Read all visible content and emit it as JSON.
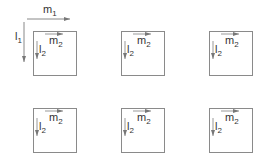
{
  "diagram": {
    "outer_axes": {
      "horizontal": {
        "label": "m",
        "subscript": "1"
      },
      "vertical": {
        "label": "l",
        "subscript": "1"
      }
    },
    "cells": [
      {
        "row": 0,
        "col": 0,
        "h_label": "m",
        "h_sub": "2",
        "v_label": "l",
        "v_sub": "2"
      },
      {
        "row": 0,
        "col": 1,
        "h_label": "m",
        "h_sub": "2",
        "v_label": "l",
        "v_sub": "2"
      },
      {
        "row": 0,
        "col": 2,
        "h_label": "m",
        "h_sub": "2",
        "v_label": "l",
        "v_sub": "2"
      },
      {
        "row": 1,
        "col": 0,
        "h_label": "m",
        "h_sub": "2",
        "v_label": "l",
        "v_sub": "2"
      },
      {
        "row": 1,
        "col": 1,
        "h_label": "m",
        "h_sub": "2",
        "v_label": "l",
        "v_sub": "2"
      },
      {
        "row": 1,
        "col": 2,
        "h_label": "m",
        "h_sub": "2",
        "v_label": "l",
        "v_sub": "2"
      }
    ],
    "colors": {
      "line": "#8a8a8a",
      "text": "#333333"
    }
  }
}
